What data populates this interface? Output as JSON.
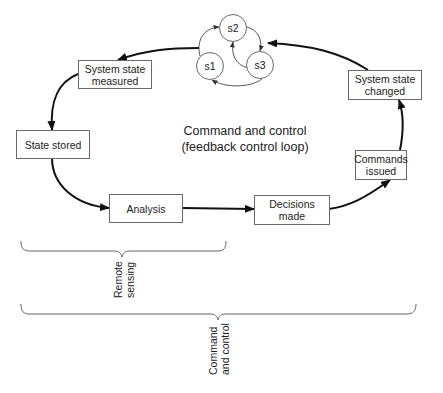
{
  "diagram": {
    "center_label": "Command and control\n(feedback control loop)",
    "nodes": [
      {
        "id": "system-state-measured",
        "label": "System state\nmeasured"
      },
      {
        "id": "state-stored",
        "label": "State stored"
      },
      {
        "id": "analysis",
        "label": "Analysis"
      },
      {
        "id": "decisions-made",
        "label": "Decisions\nmade"
      },
      {
        "id": "commands-issued",
        "label": "Commands\nissued"
      },
      {
        "id": "system-state-changed",
        "label": "System state\nchanged"
      }
    ],
    "states": [
      {
        "id": "s1",
        "label": "s1"
      },
      {
        "id": "s2",
        "label": "s2"
      },
      {
        "id": "s3",
        "label": "s3"
      }
    ],
    "edges": [
      {
        "from": "system-state-changed",
        "to": "state-machine"
      },
      {
        "from": "state-machine",
        "to": "system-state-measured"
      },
      {
        "from": "system-state-measured",
        "to": "state-stored"
      },
      {
        "from": "state-stored",
        "to": "analysis"
      },
      {
        "from": "analysis",
        "to": "decisions-made"
      },
      {
        "from": "decisions-made",
        "to": "commands-issued"
      },
      {
        "from": "commands-issued",
        "to": "system-state-changed"
      },
      {
        "from": "s1",
        "to": "s2"
      },
      {
        "from": "s2",
        "to": "s3"
      },
      {
        "from": "s3",
        "to": "s2"
      },
      {
        "from": "s3",
        "to": "s1"
      }
    ],
    "braces": [
      {
        "id": "remote-sensing",
        "label": "Remote\nsensing"
      },
      {
        "id": "command-and-control",
        "label": "Command\nand control"
      }
    ]
  }
}
